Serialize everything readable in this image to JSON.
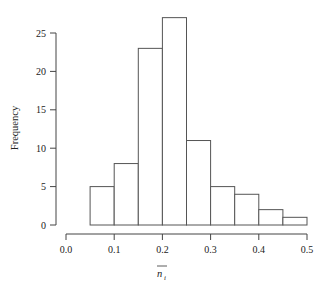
{
  "chart_data": {
    "type": "bar",
    "subtype": "histogram",
    "title": "",
    "xlabel": "n_i (with overbar)",
    "xlabel_parts": {
      "base": "n",
      "subscript": "i",
      "overbar": true
    },
    "ylabel": "Frequency",
    "bin_edges": [
      0.05,
      0.1,
      0.15,
      0.2,
      0.25,
      0.3,
      0.35,
      0.4,
      0.45,
      0.5
    ],
    "categories": [
      "0.05-0.10",
      "0.10-0.15",
      "0.15-0.20",
      "0.20-0.25",
      "0.25-0.30",
      "0.30-0.35",
      "0.35-0.40",
      "0.40-0.45",
      "0.45-0.50"
    ],
    "values": [
      5,
      8,
      23,
      27,
      11,
      5,
      4,
      2,
      1
    ],
    "xlim": [
      0.0,
      0.5
    ],
    "ylim": [
      0,
      25
    ],
    "x_ticks": [
      "0.0",
      "0.1",
      "0.2",
      "0.3",
      "0.4",
      "0.5"
    ],
    "y_ticks": [
      "0",
      "5",
      "10",
      "15",
      "20",
      "25"
    ],
    "grid": false,
    "legend": null,
    "bar_fill": "#ffffff",
    "bar_stroke": "#555555"
  }
}
